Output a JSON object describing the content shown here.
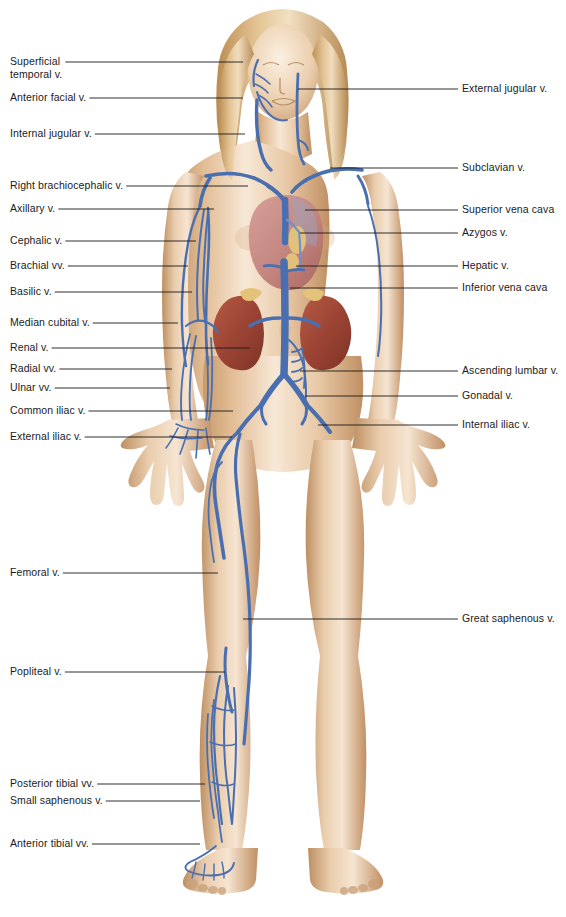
{
  "diagram": {
    "background_color": "#ffffff",
    "vein_color": "#4a6fb0",
    "vein_color_light": "#6f92cc",
    "skin_color": "#e8c9a6",
    "skin_highlight": "#f6e4cf",
    "skin_shadow": "#c79a6d",
    "hair_color": "#d9b383",
    "kidney_color": "#9e4639",
    "heart_color": "#c98d87",
    "fat_color": "#e6c87a",
    "leader_line_color": "#1a1a1a",
    "label_text_color": "#1a1a1a"
  },
  "labels_left": [
    {
      "id": "superficial-temporal-vein",
      "text": "Superficial\ntemporal v.",
      "x": 10,
      "y": 55,
      "line_y": 62,
      "line_x2": 243
    },
    {
      "id": "anterior-facial-vein",
      "text": "Anterior facial v.",
      "x": 10,
      "y": 91,
      "line_y": 98,
      "line_x2": 243
    },
    {
      "id": "internal-jugular-vein",
      "text": "Internal jugular v.",
      "x": 10,
      "y": 127,
      "line_y": 134,
      "line_x2": 245
    },
    {
      "id": "right-brachiocephalic-vein",
      "text": "Right brachiocephalic v.",
      "x": 10,
      "y": 179,
      "line_y": 186,
      "line_x2": 248
    },
    {
      "id": "axillary-vein",
      "text": "Axillary v.",
      "x": 10,
      "y": 202,
      "line_y": 209,
      "line_x2": 214
    },
    {
      "id": "cephalic-vein",
      "text": "Cephalic v.",
      "x": 10,
      "y": 234,
      "line_y": 241,
      "line_x2": 196
    },
    {
      "id": "brachial-veins",
      "text": "Brachial vv.",
      "x": 10,
      "y": 259,
      "line_y": 266,
      "line_x2": 188
    },
    {
      "id": "basilic-vein",
      "text": "Basilic v.",
      "x": 10,
      "y": 285,
      "line_y": 292,
      "line_x2": 192
    },
    {
      "id": "median-cubital-vein",
      "text": "Median cubital v.",
      "x": 10,
      "y": 316,
      "line_y": 323,
      "line_x2": 178
    },
    {
      "id": "renal-vein",
      "text": "Renal v.",
      "x": 10,
      "y": 341,
      "line_y": 348,
      "line_x2": 250
    },
    {
      "id": "radial-veins",
      "text": "Radial vv.",
      "x": 10,
      "y": 362,
      "line_y": 369,
      "line_x2": 172
    },
    {
      "id": "ulnar-veins",
      "text": "Ulnar vv.",
      "x": 10,
      "y": 381,
      "line_y": 388,
      "line_x2": 170
    },
    {
      "id": "common-iliac-vein",
      "text": "Common iliac v.",
      "x": 10,
      "y": 404,
      "line_y": 411,
      "line_x2": 233
    },
    {
      "id": "external-iliac-vein",
      "text": "External iliac v.",
      "x": 10,
      "y": 430,
      "line_y": 437,
      "line_x2": 232
    },
    {
      "id": "femoral-vein",
      "text": "Femoral v.",
      "x": 10,
      "y": 566,
      "line_y": 573,
      "line_x2": 218
    },
    {
      "id": "popliteal-vein",
      "text": "Popliteal v.",
      "x": 10,
      "y": 665,
      "line_y": 672,
      "line_x2": 225
    },
    {
      "id": "posterior-tibial-veins",
      "text": "Posterior tibial vv.",
      "x": 10,
      "y": 777,
      "line_y": 784,
      "line_x2": 205
    },
    {
      "id": "small-saphenous-vein",
      "text": "Small saphenous v.",
      "x": 10,
      "y": 794,
      "line_y": 801,
      "line_x2": 200
    },
    {
      "id": "anterior-tibial-veins",
      "text": "Anterior tibial vv.",
      "x": 10,
      "y": 837,
      "line_y": 844,
      "line_x2": 200
    }
  ],
  "labels_right": [
    {
      "id": "external-jugular-vein",
      "text": "External jugular v.",
      "x": 462,
      "y": 82,
      "line_y": 89,
      "line_x1": 298
    },
    {
      "id": "subclavian-vein",
      "text": "Subclavian v.",
      "x": 462,
      "y": 161,
      "line_y": 168,
      "line_x1": 330
    },
    {
      "id": "superior-vena-cava",
      "text": "Superior vena cava",
      "x": 462,
      "y": 203,
      "line_y": 210,
      "line_x1": 305
    },
    {
      "id": "azygos-vein",
      "text": "Azygos v.",
      "x": 462,
      "y": 226,
      "line_y": 233,
      "line_x1": 300
    },
    {
      "id": "hepatic-vein",
      "text": "Hepatic v.",
      "x": 462,
      "y": 259,
      "line_y": 266,
      "line_x1": 296
    },
    {
      "id": "inferior-vena-cava",
      "text": "Inferior vena cava",
      "x": 462,
      "y": 281,
      "line_y": 288,
      "line_x1": 290
    },
    {
      "id": "ascending-lumbar-vein",
      "text": "Ascending lumbar v.",
      "x": 462,
      "y": 364,
      "line_y": 371,
      "line_x1": 300
    },
    {
      "id": "gonadal-vein",
      "text": "Gonadal v.",
      "x": 462,
      "y": 389,
      "line_y": 396,
      "line_x1": 305
    },
    {
      "id": "internal-iliac-vein",
      "text": "Internal iliac v.",
      "x": 462,
      "y": 418,
      "line_y": 425,
      "line_x1": 318
    },
    {
      "id": "great-saphenous-vein",
      "text": "Great saphenous v.",
      "x": 462,
      "y": 612,
      "line_y": 619,
      "line_x1": 243
    }
  ]
}
